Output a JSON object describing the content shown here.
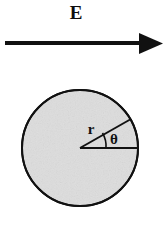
{
  "figure": {
    "title_label": "E",
    "background_color": "#ffffff",
    "ink_color": "#111111",
    "disk_fill_color": "#e3e3e3"
  },
  "field_arrow": {
    "name": "electric-field-arrow",
    "label": "E",
    "direction": "right",
    "shaft_start_x": 5,
    "shaft_end_x": 141,
    "tip_x": 163,
    "y": 43,
    "thickness": 4,
    "head_half_height": 10,
    "color": "#111111"
  },
  "disk": {
    "name": "shaded-disk",
    "center_x": 80,
    "center_y": 148,
    "radius": 59,
    "fill": "#e3e3e3",
    "stroke": "#111111",
    "stroke_width": 2
  },
  "radius_line": {
    "name": "radius-line",
    "label": "r",
    "angle_degrees": 30,
    "label_x": 91,
    "label_y": 132,
    "font_size": 15
  },
  "horizontal_radius": {
    "name": "horizontal-radius-line",
    "from_x": 80,
    "to_x": 139,
    "y": 148
  },
  "angle_arc": {
    "name": "angle-arc",
    "label": "θ",
    "radius": 26,
    "label_x": 114,
    "label_y": 143,
    "font_size": 14,
    "start_angle_degrees": 0,
    "end_angle_degrees": 30
  }
}
